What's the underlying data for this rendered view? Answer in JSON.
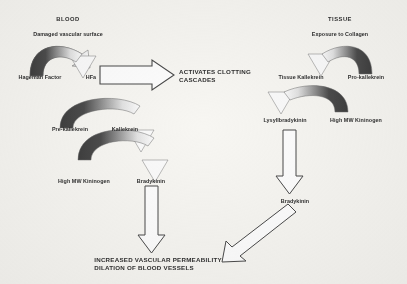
{
  "diagram": {
    "title_left": "BLOOD",
    "title_right": "TISSUE",
    "colors": {
      "background": "#f7f6f2",
      "ink": "#303030",
      "arrow_dark": "#4a4a4a",
      "arrow_light": "#ffffff",
      "arrow_outline": "#555555"
    },
    "blood_pathway": {
      "heading": "BLOOD",
      "trigger": "Damaged vascular surface",
      "steps": [
        {
          "substrate": "Hageman Factor",
          "product": "HFa"
        },
        {
          "substrate": "Pre-kallekrein",
          "product": "Kallekrein"
        },
        {
          "substrate": "High MW Kininogen",
          "product": "Bradykinin"
        }
      ]
    },
    "tissue_pathway": {
      "heading": "TISSUE",
      "trigger": "Exposure to Collagen",
      "steps": [
        {
          "substrate": "Pro-kallekrein",
          "product": "Tissue Kallekrein"
        },
        {
          "substrate": "High MW Kininogen",
          "product": "Lysyllbradykinin"
        }
      ],
      "final_mediator": "Bradykinin"
    },
    "clotting_output": "ACTIVATES CLOTTING\nCASCADES",
    "outcome": "INCREASED VASCULAR PERMEABILITY\nDILATION OF BLOOD VESSELS",
    "arrows": {
      "curved_catalysis": "curved-gradient-arrow",
      "block_right": "block-arrow-right-icon",
      "block_down": "block-arrow-down-icon",
      "block_diagonal": "block-arrow-diagonal-down-left-icon"
    }
  }
}
